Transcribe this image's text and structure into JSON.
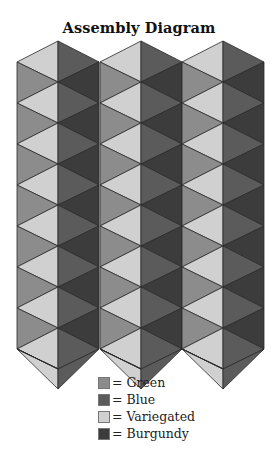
{
  "title": "Assembly Diagram",
  "colors": {
    "green": "#8c8c8c",
    "blue": "#5b5b5b",
    "variegated": "#d0d0d0",
    "burgundy": "#3c3c3c",
    "line": "#2a2a2a"
  },
  "diagram": {
    "columns": [
      {
        "left": 17,
        "center": 58,
        "right": 99
      },
      {
        "left": 100,
        "center": 141,
        "right": 182
      },
      {
        "left": 182,
        "center": 223,
        "right": 264
      }
    ],
    "center_top_y": 41,
    "edge_top_y": 62,
    "step_y": 41,
    "rows": 8,
    "left_half_pattern": [
      "variegated",
      "green"
    ],
    "right_half_pattern": [
      "blue",
      "burgundy"
    ]
  },
  "legend": [
    {
      "key": "green",
      "label": "= Green"
    },
    {
      "key": "blue",
      "label": "= Blue"
    },
    {
      "key": "variegated",
      "label": "= Variegated"
    },
    {
      "key": "burgundy",
      "label": "= Burgundy"
    }
  ]
}
